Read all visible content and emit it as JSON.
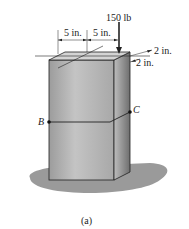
{
  "figure": {
    "load_label": "150 lb",
    "dim_left": "5 in.",
    "dim_right": "5 in.",
    "dim_depth_1": "2 in.",
    "dim_depth_2": "2 in.",
    "point_b": "B",
    "point_c": "C",
    "caption": "(a)"
  },
  "colors": {
    "front_face": "#b4b4b4",
    "side_face": "#8c8c8c",
    "top_face": "#cfcfcf",
    "shadow": "#9a9a9a",
    "line": "#222222"
  }
}
